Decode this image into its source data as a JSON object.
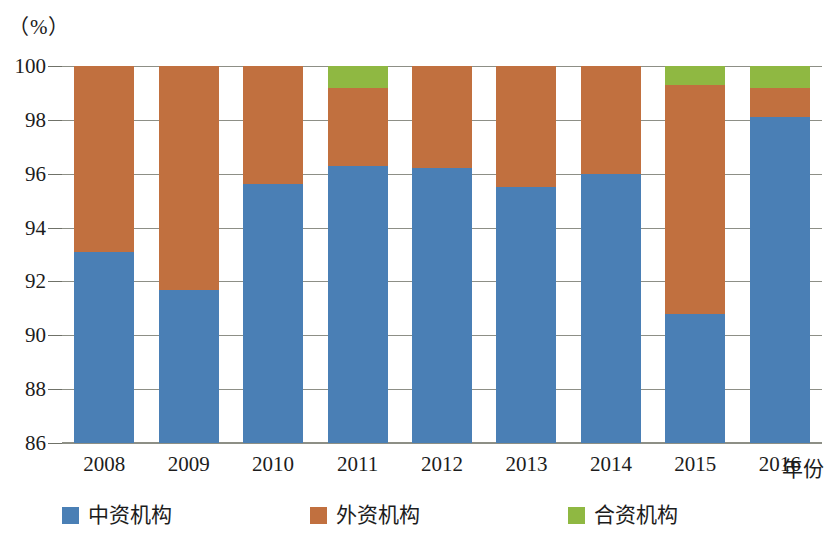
{
  "chart_data": {
    "type": "bar",
    "stacked": true,
    "title": "",
    "subtitle": "",
    "xlabel": "年份",
    "ylabel": "",
    "unit_label": "（%）",
    "categories": [
      "2008",
      "2009",
      "2010",
      "2011",
      "2012",
      "2013",
      "2014",
      "2015",
      "2016"
    ],
    "ylim": [
      86,
      100
    ],
    "ytick_labels": [
      "100",
      "98",
      "96",
      "94",
      "92",
      "90",
      "88",
      "86"
    ],
    "yticks": [
      100,
      98,
      96,
      94,
      92,
      90,
      88,
      86
    ],
    "grid": true,
    "legend_position": "bottom",
    "series": [
      {
        "name": "中资机构",
        "color": "#4a7fb5",
        "values": [
          93.1,
          91.7,
          95.6,
          96.3,
          96.2,
          95.5,
          96.0,
          90.8,
          98.1
        ]
      },
      {
        "name": "外资机构",
        "color": "#c1703f",
        "values": [
          6.9,
          8.3,
          4.4,
          2.9,
          3.8,
          4.5,
          4.0,
          8.5,
          1.1
        ]
      },
      {
        "name": "合资机构",
        "color": "#8fb842",
        "values": [
          0.0,
          0.0,
          0.0,
          0.8,
          0.0,
          0.0,
          0.0,
          0.7,
          0.8
        ]
      }
    ],
    "axis_color": "#8d8f86",
    "background": "#ffffff"
  },
  "legend": {
    "items": [
      {
        "label": "中资机构",
        "color": "#4a7fb5"
      },
      {
        "label": "外资机构",
        "color": "#c1703f"
      },
      {
        "label": "合资机构",
        "color": "#8fb842"
      }
    ]
  }
}
